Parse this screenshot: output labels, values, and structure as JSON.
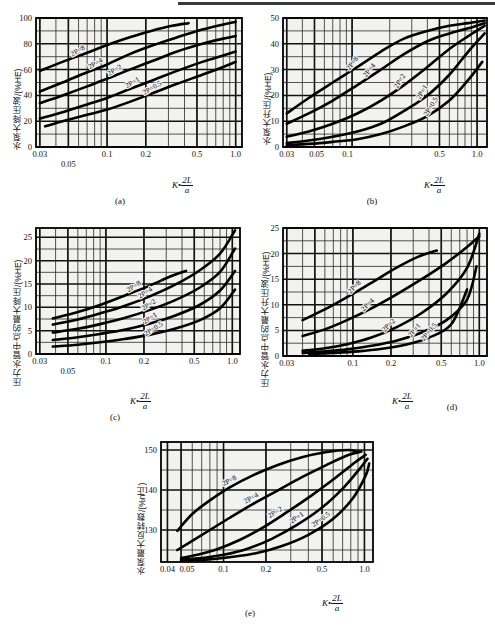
{
  "figure": {
    "top_rule": true,
    "panels": [
      "a",
      "b",
      "c",
      "d",
      "e"
    ]
  },
  "axis_label_x": {
    "k": "K",
    "dot": "•",
    "numerator": "2L",
    "denominator": "a"
  },
  "captions": {
    "a": "(a)",
    "b": "(b)",
    "c": "(c)",
    "d": "(d)",
    "e": "(e)"
  },
  "chart_data": [
    {
      "id": "a",
      "type": "line",
      "title": "(a)",
      "xlabel": "K•2L/a",
      "ylabel": "水泵大降压波/(%HE)",
      "xscale": "log",
      "xlim": [
        0.028,
        1.12
      ],
      "ylim": [
        0,
        100
      ],
      "xticks": [
        0.03,
        0.05,
        0.1,
        0.2,
        0.5,
        1.0
      ],
      "xticklabels": [
        "0.03",
        "0.05",
        "0.1",
        "0.2",
        "0.5",
        "1.0"
      ],
      "yticks": [
        0,
        20,
        40,
        60,
        80,
        100
      ],
      "yticklabels": [
        "0",
        "20",
        "40",
        "60",
        "80",
        "100"
      ],
      "grid": true,
      "series": [
        {
          "name": "2P=8",
          "label": "2P=8",
          "x": [
            0.03,
            0.045,
            0.07,
            0.1,
            0.15,
            0.22,
            0.32,
            0.43
          ],
          "y": [
            59,
            66,
            73,
            79,
            85,
            90,
            94,
            96
          ]
        },
        {
          "name": "2P=4",
          "label": "2P=4",
          "x": [
            0.03,
            0.045,
            0.07,
            0.1,
            0.15,
            0.23,
            0.35,
            0.55,
            0.8,
            1.0
          ],
          "y": [
            43,
            50,
            58,
            64,
            72,
            79,
            85,
            91,
            95,
            97
          ]
        },
        {
          "name": "2P=2",
          "label": "2P=2",
          "x": [
            0.03,
            0.045,
            0.07,
            0.1,
            0.15,
            0.23,
            0.35,
            0.55,
            0.8,
            1.0
          ],
          "y": [
            34,
            40,
            47,
            53,
            60,
            67,
            74,
            80,
            84,
            86
          ]
        },
        {
          "name": "2P=1",
          "label": "2P=1",
          "x": [
            0.03,
            0.045,
            0.07,
            0.1,
            0.15,
            0.23,
            0.35,
            0.55,
            0.8,
            1.0
          ],
          "y": [
            22,
            27,
            33,
            38,
            45,
            52,
            59,
            66,
            71,
            74
          ]
        },
        {
          "name": "2P=0.5",
          "label": "2P=0.5",
          "x": [
            0.033,
            0.045,
            0.07,
            0.1,
            0.15,
            0.23,
            0.35,
            0.55,
            0.8,
            1.0
          ],
          "y": [
            16,
            20,
            25,
            29,
            35,
            42,
            49,
            56,
            62,
            66
          ]
        }
      ]
    },
    {
      "id": "b",
      "type": "line",
      "title": "(b)",
      "xlabel": "K•2L/a",
      "ylabel": "水泵大升压/(%HE)",
      "xscale": "log",
      "xlim": [
        0.028,
        1.2
      ],
      "ylim": [
        0,
        50
      ],
      "xticks": [
        0.03,
        0.05,
        0.1,
        0.5,
        1.0
      ],
      "xticklabels": [
        "0.03",
        "0.05",
        "0.1",
        "0.5",
        "1.0"
      ],
      "yticks": [
        0,
        10,
        20,
        30,
        40,
        50
      ],
      "yticklabels": [
        "0",
        "10",
        "20",
        "30",
        "40",
        "50"
      ],
      "grid": true,
      "series": [
        {
          "name": "2P=8",
          "label": "2P=8",
          "x": [
            0.03,
            0.045,
            0.07,
            0.11,
            0.17,
            0.26,
            0.4,
            0.6,
            0.85,
            1.15
          ],
          "y": [
            13,
            19,
            25,
            31,
            37,
            42,
            45,
            47,
            48,
            49
          ]
        },
        {
          "name": "2P=4",
          "label": "2P=4",
          "x": [
            0.03,
            0.045,
            0.07,
            0.11,
            0.17,
            0.26,
            0.4,
            0.6,
            0.85,
            1.15
          ],
          "y": [
            9,
            13,
            18,
            24,
            30,
            36,
            41,
            44,
            46,
            48
          ]
        },
        {
          "name": "2P=2",
          "label": "2P=2",
          "x": [
            0.03,
            0.045,
            0.07,
            0.11,
            0.17,
            0.26,
            0.4,
            0.6,
            0.85,
            1.15
          ],
          "y": [
            4,
            6,
            9,
            13,
            18,
            24,
            31,
            38,
            43,
            47
          ]
        },
        {
          "name": "2P=1",
          "label": "2P=1",
          "x": [
            0.03,
            0.045,
            0.07,
            0.11,
            0.17,
            0.26,
            0.4,
            0.6,
            0.85,
            1.15
          ],
          "y": [
            1.5,
            2.5,
            4,
            6,
            9,
            14,
            20,
            28,
            37,
            44
          ]
        },
        {
          "name": "2P=0.5",
          "label": "2P=0.5",
          "x": [
            0.03,
            0.045,
            0.07,
            0.11,
            0.17,
            0.26,
            0.4,
            0.6,
            0.85,
            1.1
          ],
          "y": [
            0.7,
            1.2,
            2,
            3,
            5,
            8,
            12,
            18,
            26,
            33
          ]
        }
      ]
    },
    {
      "id": "c",
      "type": "line",
      "title": "(c)",
      "xlabel": "K•2L/a",
      "ylabel": "压力水管中点的最大降压/(%HE)",
      "xscale": "log",
      "xlim": [
        0.028,
        1.15
      ],
      "ylim": [
        0,
        27
      ],
      "xticks": [
        0.03,
        0.05,
        0.1,
        0.2,
        0.5,
        1.0
      ],
      "xticklabels": [
        "0.03",
        "0.05",
        "0.1",
        "0.2",
        "0.5",
        "1.0"
      ],
      "yticks": [
        0,
        5,
        10,
        15,
        20,
        25
      ],
      "yticklabels": [
        "0",
        "5",
        "10",
        "15",
        "20",
        "25"
      ],
      "grid": true,
      "series": [
        {
          "name": "2P=8",
          "label": "2P=8",
          "x": [
            0.038,
            0.06,
            0.09,
            0.14,
            0.22,
            0.33,
            0.43
          ],
          "y": [
            7.6,
            9.0,
            10.5,
            12.5,
            14.6,
            16.7,
            17.8
          ]
        },
        {
          "name": "2P=4",
          "label": "2P=4",
          "x": [
            0.038,
            0.06,
            0.09,
            0.14,
            0.22,
            0.35,
            0.55,
            0.8,
            1.05
          ],
          "y": [
            6.3,
            7.4,
            8.7,
            10.3,
            12.3,
            14.8,
            17.9,
            21.5,
            26.5
          ]
        },
        {
          "name": "2P=2",
          "label": "2P=2",
          "x": [
            0.038,
            0.06,
            0.09,
            0.14,
            0.22,
            0.35,
            0.55,
            0.8,
            1.05
          ],
          "y": [
            4.6,
            5.4,
            6.4,
            7.7,
            9.4,
            11.5,
            14.2,
            17.6,
            22.6
          ]
        },
        {
          "name": "2P=1",
          "label": "2P=1",
          "x": [
            0.038,
            0.06,
            0.09,
            0.14,
            0.22,
            0.35,
            0.55,
            0.8,
            1.05
          ],
          "y": [
            3.0,
            3.6,
            4.3,
            5.2,
            6.5,
            8.2,
            10.5,
            13.6,
            17.8
          ]
        },
        {
          "name": "2P=0.5",
          "label": "2P=0.5",
          "x": [
            0.038,
            0.06,
            0.09,
            0.14,
            0.22,
            0.35,
            0.55,
            0.8,
            1.05
          ],
          "y": [
            1.6,
            2.0,
            2.5,
            3.2,
            4.1,
            5.4,
            7.2,
            9.8,
            13.8
          ]
        }
      ]
    },
    {
      "id": "d",
      "type": "line",
      "title": "(d)",
      "xlabel": "K•2L/a",
      "ylabel": "压力水管中点的最大升压波/(%HE)",
      "xscale": "log",
      "xlim": [
        0.028,
        1.15
      ],
      "ylim": [
        0,
        25
      ],
      "xticks": [
        0.03,
        0.05,
        0.1,
        0.2,
        0.5,
        1.0
      ],
      "xticklabels": [
        "0.03",
        "0.1",
        "0.2",
        "0.5",
        "1.0"
      ],
      "yticks": [
        0,
        5,
        10,
        15,
        20,
        25
      ],
      "yticklabels": [
        "0",
        "5",
        "10",
        "15",
        "20",
        "25"
      ],
      "grid": true,
      "series": [
        {
          "name": "2P=8",
          "label": "2P=8",
          "x": [
            0.04,
            0.06,
            0.09,
            0.14,
            0.22,
            0.33,
            0.46
          ],
          "y": [
            7.0,
            9.1,
            11.5,
            14.3,
            17.2,
            19.4,
            20.6
          ]
        },
        {
          "name": "2P=4",
          "label": "2P=4",
          "x": [
            0.04,
            0.06,
            0.09,
            0.14,
            0.22,
            0.35,
            0.55,
            0.8,
            1.0
          ],
          "y": [
            3.9,
            5.2,
            7.0,
            9.3,
            12.0,
            15.0,
            18.2,
            21.3,
            23.4
          ]
        },
        {
          "name": "2P=2",
          "label": "2P=2",
          "x": [
            0.04,
            0.06,
            0.09,
            0.14,
            0.22,
            0.35,
            0.55,
            0.8,
            1.0
          ],
          "y": [
            1.0,
            1.5,
            2.3,
            3.6,
            5.6,
            8.4,
            12.2,
            17.2,
            23.9
          ]
        },
        {
          "name": "2P=1",
          "label": "2P=1",
          "x": [
            0.04,
            0.06,
            0.09,
            0.14,
            0.22,
            0.35,
            0.55,
            0.8,
            0.95
          ],
          "y": [
            0.6,
            0.9,
            1.3,
            2.0,
            3.0,
            4.6,
            7.0,
            11.0,
            17.5
          ]
        },
        {
          "name": "2P=0.5",
          "label": "2P=0.5",
          "x": [
            0.045,
            0.07,
            0.11,
            0.17,
            0.26,
            0.4,
            0.6,
            0.8
          ],
          "y": [
            0.4,
            0.6,
            0.9,
            1.4,
            2.2,
            3.6,
            6.2,
            13.0
          ]
        }
      ]
    },
    {
      "id": "e",
      "type": "line",
      "title": "(e)",
      "xlabel": "K•2L/a",
      "ylabel": "水泵最大反转数/(%n正)",
      "xscale": "log",
      "xlim": [
        0.036,
        1.15
      ],
      "ylim": [
        122,
        152
      ],
      "xticks": [
        0.04,
        0.05,
        0.1,
        0.2,
        0.5,
        1.0
      ],
      "xticklabels": [
        "0.04",
        "0.05",
        "0.1",
        "0.2",
        "0.5",
        "1.0"
      ],
      "yticks": [
        130,
        140,
        150
      ],
      "yticklabels": [
        "130",
        "140",
        "150"
      ],
      "grid": true,
      "series": [
        {
          "name": "2P=8",
          "label": "2P=8",
          "x": [
            0.047,
            0.06,
            0.08,
            0.11,
            0.16,
            0.24,
            0.36,
            0.54,
            0.76,
            0.9
          ],
          "y": [
            129.8,
            134.0,
            137.4,
            140.6,
            143.6,
            146.2,
            148.2,
            149.5,
            150.0,
            149.6
          ]
        },
        {
          "name": "2P=4",
          "label": "2P=4",
          "x": [
            0.047,
            0.06,
            0.08,
            0.11,
            0.16,
            0.24,
            0.36,
            0.54,
            0.76,
            0.95
          ],
          "y": [
            125.0,
            127.3,
            130.0,
            133.0,
            136.4,
            139.8,
            143.2,
            146.3,
            148.7,
            149.6
          ]
        },
        {
          "name": "2P=2",
          "label": "2P=2",
          "x": [
            0.05,
            0.065,
            0.09,
            0.13,
            0.19,
            0.28,
            0.42,
            0.62,
            0.85,
            1.02
          ],
          "y": [
            123.0,
            123.8,
            125.2,
            127.5,
            130.6,
            134.4,
            138.6,
            143.0,
            146.8,
            148.8
          ]
        },
        {
          "name": "2P=1",
          "label": "2P=1",
          "x": [
            0.05,
            0.07,
            0.1,
            0.15,
            0.22,
            0.33,
            0.5,
            0.72,
            0.95,
            1.05
          ],
          "y": [
            122.6,
            123.0,
            123.8,
            125.4,
            127.8,
            131.2,
            135.6,
            140.8,
            145.8,
            147.8
          ]
        },
        {
          "name": "2P=0.5",
          "label": "2P=0.5",
          "x": [
            0.05,
            0.075,
            0.11,
            0.17,
            0.26,
            0.4,
            0.6,
            0.83,
            1.02,
            1.08
          ],
          "y": [
            122.4,
            122.6,
            123.2,
            124.2,
            126.0,
            128.8,
            132.8,
            138.0,
            143.6,
            146.6
          ]
        }
      ]
    }
  ]
}
